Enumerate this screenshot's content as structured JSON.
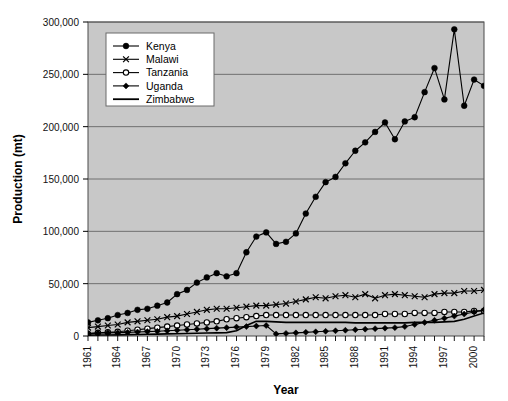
{
  "chart_data": {
    "type": "line",
    "title": "",
    "xlabel": "Year",
    "ylabel": "Production (mt)",
    "xlim": [
      1961,
      2001
    ],
    "ylim": [
      0,
      300000
    ],
    "ytick_labels": [
      "0",
      "50,000",
      "100,000",
      "150,000",
      "200,000",
      "250,000",
      "300,000"
    ],
    "ytick_values": [
      0,
      50000,
      100000,
      150000,
      200000,
      250000,
      300000
    ],
    "xtick_labels": [
      "1961",
      "1964",
      "1967",
      "1970",
      "1973",
      "1976",
      "1979",
      "1982",
      "1985",
      "1988",
      "1991",
      "1994",
      "1997",
      "2000"
    ],
    "xtick_values": [
      1961,
      1964,
      1967,
      1970,
      1973,
      1976,
      1979,
      1982,
      1985,
      1988,
      1991,
      1994,
      1997,
      2000
    ],
    "grid": "horizontal",
    "plot_background": "#c8c8c8",
    "legend_position": "top-left-inside",
    "legend_background": "#ffffff",
    "x": [
      1961,
      1962,
      1963,
      1964,
      1965,
      1966,
      1967,
      1968,
      1969,
      1970,
      1971,
      1972,
      1973,
      1974,
      1975,
      1976,
      1977,
      1978,
      1979,
      1980,
      1981,
      1982,
      1983,
      1984,
      1985,
      1986,
      1987,
      1988,
      1989,
      1990,
      1991,
      1992,
      1993,
      1994,
      1995,
      1996,
      1997,
      1998,
      1999,
      2000,
      2001
    ],
    "series": [
      {
        "name": "Kenya",
        "marker": "filled-circle",
        "color": "#000000",
        "values": [
          13000,
          15000,
          17000,
          20000,
          22000,
          25000,
          26000,
          29000,
          32000,
          40000,
          44000,
          51000,
          56000,
          60000,
          57000,
          60000,
          80000,
          95000,
          99000,
          88000,
          90000,
          98000,
          117000,
          133000,
          147000,
          152000,
          165000,
          177000,
          185000,
          195000,
          204000,
          188000,
          205000,
          209000,
          233000,
          256000,
          226000,
          293000,
          220000,
          245000,
          239000
        ]
      },
      {
        "name": "Malawi",
        "marker": "cross",
        "color": "#000000",
        "values": [
          8000,
          9000,
          10000,
          11000,
          13000,
          14000,
          15000,
          16000,
          18000,
          19000,
          21000,
          23000,
          25000,
          26000,
          26000,
          27000,
          28000,
          29000,
          29000,
          30000,
          31000,
          33000,
          35000,
          37000,
          36000,
          38000,
          39000,
          37000,
          40000,
          36000,
          39000,
          40000,
          39000,
          38000,
          37000,
          40000,
          41000,
          41000,
          43000,
          43000,
          44000
        ]
      },
      {
        "name": "Tanzania",
        "marker": "open-circle",
        "color": "#000000",
        "values": [
          2000,
          3000,
          3500,
          4000,
          5000,
          6000,
          7000,
          8000,
          9000,
          10000,
          11000,
          12000,
          13000,
          14000,
          16000,
          17000,
          18000,
          19000,
          20000,
          20000,
          20000,
          20000,
          20000,
          20000,
          20000,
          20000,
          20000,
          20000,
          20000,
          20000,
          21000,
          21000,
          21000,
          22000,
          22000,
          22000,
          23000,
          23000,
          23000,
          24000,
          24000
        ]
      },
      {
        "name": "Uganda",
        "marker": "filled-diamond",
        "color": "#000000",
        "values": [
          2500,
          2800,
          3000,
          3200,
          3500,
          3800,
          4200,
          4500,
          5000,
          5500,
          6000,
          6500,
          7000,
          7500,
          8000,
          8500,
          9000,
          9500,
          10000,
          2000,
          2500,
          3000,
          3500,
          4000,
          4500,
          5000,
          5500,
          6000,
          6500,
          7000,
          7500,
          8000,
          9000,
          11000,
          13000,
          15000,
          17000,
          19000,
          21000,
          23000,
          25000
        ]
      },
      {
        "name": "Zimbabwe",
        "marker": "none",
        "color": "#000000",
        "values": [
          800,
          900,
          1000,
          1100,
          1300,
          1500,
          1700,
          1800,
          2000,
          2200,
          2400,
          2600,
          2800,
          3000,
          3200,
          5000,
          10000,
          14000,
          14000,
          13500,
          13000,
          13000,
          13000,
          13000,
          13000,
          13000,
          13000,
          12500,
          12500,
          12500,
          12500,
          12500,
          12500,
          13000,
          13000,
          13000,
          13500,
          14000,
          16000,
          19000,
          22000
        ]
      }
    ]
  },
  "legend": {
    "items": [
      {
        "label": "Kenya"
      },
      {
        "label": "Malawi"
      },
      {
        "label": "Tanzania"
      },
      {
        "label": "Uganda"
      },
      {
        "label": "Zimbabwe"
      }
    ]
  }
}
